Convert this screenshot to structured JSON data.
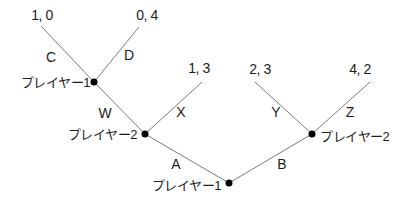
{
  "colors": {
    "background": "#ffffff",
    "line": "#7b7b7b",
    "node_dot": "#000000",
    "text": "#1c1c1c"
  },
  "tree": {
    "root": {
      "label": "プレイヤー1",
      "branches": [
        {
          "action": "A",
          "child": {
            "label": "プレイヤー2",
            "branches": [
              {
                "action": "W",
                "child": {
                  "label": "プレイヤー1",
                  "branches": [
                    {
                      "action": "C",
                      "payoff": "1, 0"
                    },
                    {
                      "action": "D",
                      "payoff": "0, 4"
                    }
                  ]
                }
              },
              {
                "action": "X",
                "payoff": "1, 3"
              }
            ]
          }
        },
        {
          "action": "B",
          "child": {
            "label": "プレイヤー2",
            "branches": [
              {
                "action": "Y",
                "payoff": "2, 3"
              },
              {
                "action": "Z",
                "payoff": "4, 2"
              }
            ]
          }
        }
      ]
    }
  }
}
